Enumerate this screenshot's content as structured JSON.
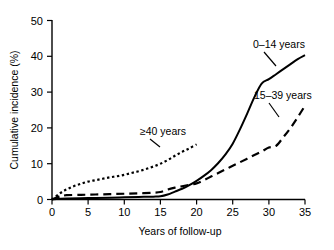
{
  "chart_data": {
    "type": "line",
    "title": "",
    "xlabel": "Years of follow-up",
    "ylabel": "Cumulative incidence (%)",
    "xlim": [
      0,
      35
    ],
    "ylim": [
      0,
      50
    ],
    "xticks": [
      "0",
      "5",
      "10",
      "15",
      "20",
      "25",
      "30",
      "35"
    ],
    "yticks": [
      "0",
      "10",
      "20",
      "30",
      "40",
      "50"
    ],
    "grid": false,
    "legend_position": "inline-annotations",
    "series": [
      {
        "name": "0–14 years",
        "style": "solid",
        "color": "#000000",
        "x": [
          0,
          1,
          2,
          5,
          8,
          10,
          12,
          14,
          15,
          16,
          17,
          18,
          19,
          20,
          21,
          22,
          23,
          24,
          25,
          26,
          27,
          28,
          29,
          30,
          31,
          32,
          33,
          34,
          35
        ],
        "y": [
          0,
          0.2,
          0.3,
          0.4,
          0.5,
          0.6,
          0.7,
          0.8,
          0.9,
          1.4,
          2.2,
          3.0,
          4.0,
          5.2,
          6.6,
          8.2,
          10.2,
          12.6,
          15.6,
          19.6,
          24.0,
          28.6,
          32.4,
          33.6,
          35.0,
          36.4,
          37.8,
          39.2,
          40.3
        ]
      },
      {
        "name": "15–39 years",
        "style": "dashed",
        "color": "#000000",
        "x": [
          0,
          1,
          2,
          4,
          6,
          8,
          10,
          12,
          14,
          15,
          16,
          17,
          18,
          19,
          20,
          21,
          22,
          23,
          24,
          25,
          26,
          27,
          28,
          29,
          30,
          31,
          32,
          33,
          34,
          35
        ],
        "y": [
          0,
          0.8,
          1.2,
          1.3,
          1.4,
          1.5,
          1.6,
          1.7,
          1.9,
          2.1,
          2.8,
          3.3,
          3.7,
          4.1,
          4.5,
          5.4,
          6.4,
          7.4,
          8.4,
          9.4,
          10.4,
          11.4,
          12.4,
          13.4,
          14.5,
          15.0,
          17.4,
          20.0,
          23.0,
          26.2
        ]
      },
      {
        "name": "≥40 years",
        "style": "dotted",
        "color": "#000000",
        "x": [
          0,
          1,
          2,
          3,
          4,
          5,
          6,
          7,
          8,
          9,
          10,
          11,
          12,
          13,
          14,
          15,
          16,
          17,
          18,
          19,
          20
        ],
        "y": [
          0,
          1.6,
          2.8,
          3.7,
          4.4,
          5.0,
          5.4,
          5.8,
          6.2,
          6.5,
          6.9,
          7.4,
          7.9,
          8.5,
          9.2,
          10.0,
          11.0,
          12.2,
          13.3,
          14.3,
          15.4
        ]
      }
    ],
    "annotations": [
      {
        "text": "0–14 years",
        "near_series": "0–14 years"
      },
      {
        "text": "15–39 years",
        "near_series": "15–39 years"
      },
      {
        "text": "≥40 years",
        "near_series": "≥40 years"
      }
    ]
  }
}
